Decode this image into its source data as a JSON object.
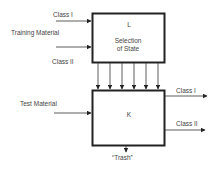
{
  "diagram": {
    "box_top": {
      "letter": "L",
      "line1": "Selection",
      "line2": "of State"
    },
    "box_bottom": {
      "letter": "K"
    },
    "inputs_top": {
      "class1": "Class I",
      "group": "Training Material",
      "class2": "Class II"
    },
    "input_bottom": "Test Material",
    "outputs": {
      "class1": "Class I",
      "class2": "Class II",
      "trash": "“Trash”"
    },
    "connector_count": 6
  }
}
